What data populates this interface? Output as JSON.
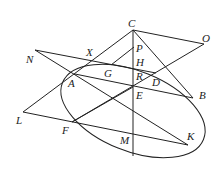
{
  "diagram": {
    "type": "geometry",
    "points": {
      "C": {
        "label": "C",
        "x": 133,
        "y": 30,
        "lx": 128,
        "ly": 27
      },
      "O": {
        "label": "O",
        "x": 204,
        "y": 44,
        "lx": 202,
        "ly": 42
      },
      "P": {
        "label": "P",
        "x": 134,
        "y": 47,
        "lx": 136,
        "ly": 52
      },
      "N": {
        "label": "N",
        "x": 35,
        "y": 50,
        "lx": 26,
        "ly": 63
      },
      "X": {
        "label": "X",
        "x": 93,
        "y": 56,
        "lx": 86,
        "ly": 56
      },
      "H": {
        "label": "H",
        "x": 133,
        "y": 68,
        "lx": 136,
        "ly": 66
      },
      "G": {
        "label": "G",
        "x": 111,
        "y": 65,
        "lx": 104,
        "ly": 77
      },
      "A": {
        "label": "A",
        "x": 75,
        "y": 74,
        "lx": 68,
        "ly": 87
      },
      "R": {
        "label": "R",
        "x": 133,
        "y": 78,
        "lx": 136,
        "ly": 80
      },
      "D": {
        "label": "D",
        "x": 156,
        "y": 73,
        "lx": 152,
        "ly": 86
      },
      "E": {
        "label": "E",
        "x": 133,
        "y": 87,
        "lx": 136,
        "ly": 99
      },
      "B": {
        "label": "B",
        "x": 193,
        "y": 98,
        "lx": 199,
        "ly": 99
      },
      "L": {
        "label": "L",
        "x": 23,
        "y": 112,
        "lx": 16,
        "ly": 124
      },
      "F": {
        "label": "F",
        "x": 72,
        "y": 122,
        "lx": 62,
        "ly": 134
      },
      "M": {
        "label": "M",
        "x": 133,
        "y": 137,
        "lx": 120,
        "ly": 144
      },
      "K": {
        "label": "K",
        "x": 188,
        "y": 145,
        "lx": 187,
        "ly": 140
      }
    },
    "segments": [
      [
        "C",
        "L"
      ],
      [
        "C",
        "B"
      ],
      [
        "C",
        "O"
      ],
      [
        "O",
        "F"
      ],
      [
        "N",
        "D"
      ],
      [
        "N",
        "K"
      ],
      [
        "A",
        "B"
      ],
      [
        "L",
        "K"
      ],
      [
        "F",
        "E"
      ],
      [
        "G",
        "P"
      ]
    ],
    "vertical_axis": {
      "x": 133,
      "y1": 30,
      "y2": 156
    },
    "ellipse": {
      "cx": 133,
      "cy": 111,
      "rx": 76,
      "ry": 40,
      "rotate": 22
    }
  }
}
